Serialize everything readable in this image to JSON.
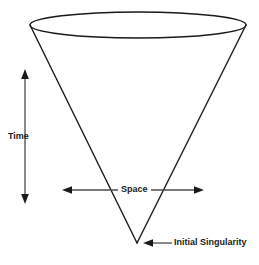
{
  "figure": {
    "type": "cosmology-light-cone-diagram",
    "background_color": "#ffffff",
    "stroke_color": "#1a1a1a",
    "arrow_color": "#4d4d4d",
    "text_color": "#1a1a1a"
  },
  "labels": {
    "time": "Time",
    "space": "Space",
    "singularity": "Initial Singularity"
  },
  "icons": {
    "time_axis": "double-headed-vertical-arrow",
    "space_axis": "double-headed-horizontal-arrow",
    "singularity_pointer": "left-pointing-arrow",
    "cone": "inverted-cone-outline",
    "cone_top": "ellipse-outline"
  },
  "geometry": {
    "cone_apex": {
      "x": 137,
      "y": 243
    },
    "cone_top_ellipse": {
      "cx": 138,
      "cy": 25,
      "rx": 108,
      "ry": 13
    },
    "time_arrow": {
      "x": 25,
      "y_top": 70,
      "y_bottom": 203
    },
    "space_arrow": {
      "y": 190,
      "x_left": 63,
      "x_right": 203
    },
    "singularity_arrow": {
      "y": 243,
      "x_from": 172,
      "x_to": 144
    }
  }
}
